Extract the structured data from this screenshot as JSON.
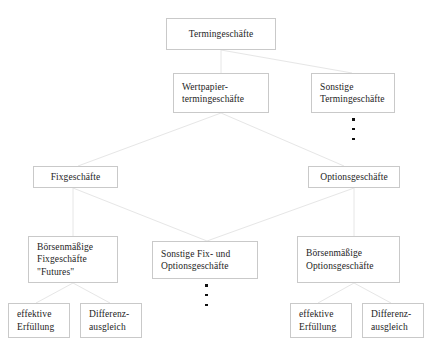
{
  "diagram": {
    "line_color": "#e3e3e3",
    "box_border_color": "#c9c9c9",
    "text_color": "#1d1d1d",
    "background": "#ffffff",
    "nodes": [
      {
        "id": "termingeschaefte",
        "label": "Termingeschäfte"
      },
      {
        "id": "wertpapier",
        "label": "Wertpapier-\ntermingeschäfte"
      },
      {
        "id": "sonstige-termin",
        "label": "Sonstige\nTermingeschäfte"
      },
      {
        "id": "fixgeschaefte",
        "label": "Fixgeschäfte"
      },
      {
        "id": "optionsgeschaefte",
        "label": "Optionsgeschäfte"
      },
      {
        "id": "boersen-fix",
        "label": "Börsenmäßige\nFixgeschäfte\n\"Futures\""
      },
      {
        "id": "sonstige-fix-optionen",
        "label": "Sonstige Fix- und\nOptionsgeschäfte"
      },
      {
        "id": "boersen-optionen",
        "label": "Börsenmäßige\nOptionsgeschäfte"
      },
      {
        "id": "effektive-erfuellung-l",
        "label": "effektive\nErfüllung"
      },
      {
        "id": "differenzausgleich-l",
        "label": "Differenz-\nausgleich"
      },
      {
        "id": "effektive-erfuellung-r",
        "label": "effektive\nErfüllung"
      },
      {
        "id": "differenzausgleich-r",
        "label": "Differenz-\nausgleich"
      }
    ],
    "ellipses": [
      {
        "id": "ellipsis-sonstige-termin",
        "dots": 3
      },
      {
        "id": "ellipsis-sonstige-fix",
        "dots": 3
      }
    ]
  }
}
